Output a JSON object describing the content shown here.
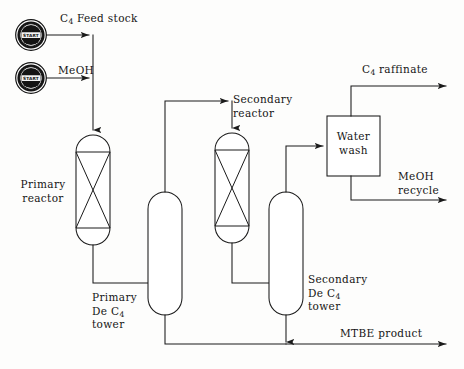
{
  "diagram": {
    "type": "process-flow-diagram",
    "line_color": "#1a1a1a",
    "background_color": "#fdfdfc",
    "width": 464,
    "height": 369
  },
  "start_nodes": [
    {
      "id": "start-c4",
      "label": "START",
      "stream": "C4 Feed stock"
    },
    {
      "id": "start-meoh",
      "label": "START",
      "stream": "MeOH"
    }
  ],
  "streams": {
    "c4_feed": {
      "label_prefix": "C",
      "label_sub": "4",
      "label_suffix": " Feed stock"
    },
    "meoh_feed": {
      "label": "MeOH"
    },
    "c4_raffinate": {
      "label_prefix": "C",
      "label_sub": "4",
      "label_suffix": " raffinate"
    },
    "meoh_recycle": {
      "line1": "MeOH",
      "line2": "recycle"
    },
    "mtbe_product": {
      "label": "MTBE product"
    }
  },
  "equipment": [
    {
      "id": "primary-reactor",
      "kind": "packed-reactor",
      "label_line1": "Primary",
      "label_line2": "reactor"
    },
    {
      "id": "primary-de-c4-tower",
      "kind": "column",
      "label_line1": "Primary",
      "label_line2_prefix": "De C",
      "label_line2_sub": "4",
      "label_line3": "tower"
    },
    {
      "id": "secondary-reactor",
      "kind": "packed-reactor",
      "label_line1": "Secondary",
      "label_line2": "reactor"
    },
    {
      "id": "secondary-de-c4-tower",
      "kind": "column",
      "label_line1": "Secondary",
      "label_line2_prefix": "De C",
      "label_line2_sub": "4",
      "label_line3": "tower"
    },
    {
      "id": "water-wash",
      "kind": "box",
      "label_line1": "Water",
      "label_line2": "wash"
    }
  ]
}
